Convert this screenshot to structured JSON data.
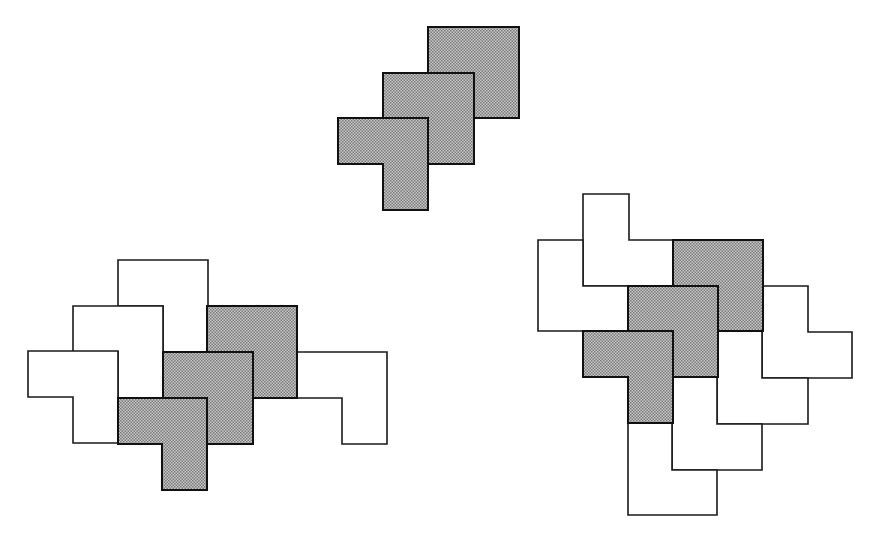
{
  "figure": {
    "unit_px": 45,
    "colors": {
      "grey_fill_dark": "#8c8c8c",
      "grey_fill_light": "#c8c8c8",
      "outline": "#1a1a1a",
      "white_fill": "#ffffff"
    },
    "compositions": [
      {
        "name": "top-stack",
        "tiles": [
          {
            "id": "top-grey-1",
            "shade": "grey",
            "points": "428,27 519,27 519,118 474,118 474,73 428,73"
          },
          {
            "id": "top-grey-2",
            "shade": "grey",
            "points": "383,73 474,73 474,164 428,164 428,118 383,118"
          },
          {
            "id": "top-grey-3",
            "shade": "grey",
            "points": "338,118 428,118 428,210 383,210 383,164 338,164"
          }
        ]
      },
      {
        "name": "left-cluster",
        "tiles": [
          {
            "id": "left-white-1",
            "shade": "white",
            "points": "118,260 208,260 208,352 163,352 163,306 118,306"
          },
          {
            "id": "left-white-2",
            "shade": "white",
            "points": "73,306 163,306 163,398 118,398 118,352 73,352"
          },
          {
            "id": "left-white-3",
            "shade": "white",
            "points": "28,351 118,351 118,443 73,443 73,397 28,397"
          },
          {
            "id": "left-white-4",
            "shade": "white",
            "points": "297,352 387,352 387,444 342,444 342,398 297,398"
          },
          {
            "id": "left-grey-1",
            "shade": "grey",
            "points": "207,306 297,306 297,398 253,398 253,352 207,352"
          },
          {
            "id": "left-grey-2",
            "shade": "grey",
            "points": "163,352 253,352 253,444 207,444 207,398 163,398"
          },
          {
            "id": "left-grey-3",
            "shade": "grey",
            "points": "118,398 207,398 207,490 162,490 162,444 118,444"
          }
        ]
      },
      {
        "name": "right-cluster",
        "tiles": [
          {
            "id": "right-white-1",
            "shade": "white",
            "points": "583,194 629,194 629,240 673,240 673,286 583,286"
          },
          {
            "id": "right-white-2",
            "shade": "white",
            "points": "538,240 583,240 583,286 628,286 628,331 538,331"
          },
          {
            "id": "right-white-3",
            "shade": "white",
            "points": "762,286 808,286 808,332 852,332 852,378 762,378"
          },
          {
            "id": "right-white-4",
            "shade": "white",
            "points": "717,331 762,331 762,378 808,378 808,424 717,424"
          },
          {
            "id": "right-white-5",
            "shade": "white",
            "points": "672,377 717,377 717,424 762,424 762,470 672,470"
          },
          {
            "id": "right-white-6",
            "shade": "white",
            "points": "628,423 672,423 672,470 717,470 717,515 628,515"
          },
          {
            "id": "right-grey-1",
            "shade": "grey",
            "points": "673,240 763,240 763,331 718,331 718,286 673,286"
          },
          {
            "id": "right-grey-2",
            "shade": "grey",
            "points": "628,286 718,286 718,377 673,377 673,331 628,331"
          },
          {
            "id": "right-grey-3",
            "shade": "grey",
            "points": "583,331 673,331 673,423 628,423 628,377 583,377"
          }
        ]
      }
    ]
  }
}
